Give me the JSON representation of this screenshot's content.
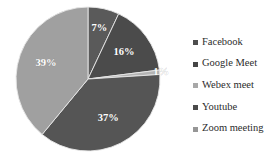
{
  "chart_data": {
    "type": "pie",
    "title": "",
    "subtitle": "",
    "xlabel": "",
    "ylabel": "",
    "grid": false,
    "legend_position": "right",
    "start_angle_deg": 0,
    "direction": "clockwise",
    "units": "percent",
    "categories": [
      "Facebook",
      "Google Meet",
      "Webex meet",
      "Youtube",
      "Zoom meeting"
    ],
    "values": [
      7,
      16,
      1,
      37,
      39
    ],
    "data_labels": [
      "7%",
      "16%",
      "1%",
      "37%",
      "39%"
    ],
    "colors": [
      "#5a5a5a",
      "#4b4b4b",
      "#b4b4b4",
      "#555555",
      "#a0a0a0"
    ],
    "slices": [
      {
        "label": "Facebook",
        "value": 7,
        "data_label": "7%",
        "color": "#5a5a5a",
        "marker_color": "#4e4e4e"
      },
      {
        "label": "Google Meet",
        "value": 16,
        "data_label": "16%",
        "color": "#4b4b4b",
        "marker_color": "#454545"
      },
      {
        "label": "Webex meet",
        "value": 1,
        "data_label": "1%",
        "color": "#b4b4b4",
        "marker_color": "#a8a8a8"
      },
      {
        "label": "Youtube",
        "value": 37,
        "data_label": "37%",
        "color": "#555555",
        "marker_color": "#4a4a4a"
      },
      {
        "label": "Zoom meeting",
        "value": 39,
        "data_label": "39%",
        "color": "#a0a0a0",
        "marker_color": "#969696"
      }
    ]
  },
  "legend": {
    "items": [
      {
        "label": "Facebook"
      },
      {
        "label": "Google Meet"
      },
      {
        "label": "Webex meet"
      },
      {
        "label": "Youtube"
      },
      {
        "label": "Zoom meeting"
      }
    ]
  },
  "colors": {
    "background": "#ffffff",
    "label_text": "#ffffff",
    "legend_text": "#2c2c2c",
    "slice_border": "#e8e8e8"
  }
}
